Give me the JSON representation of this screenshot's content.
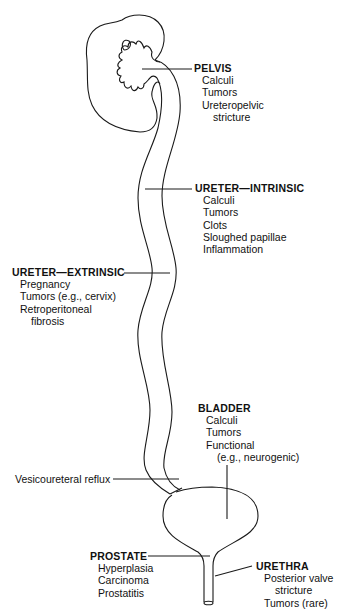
{
  "diagram": {
    "title": "",
    "labels": {
      "pelvis": {
        "heading": "PELVIS",
        "items": [
          "Calculi",
          "Tumors",
          "Ureteropelvic",
          "stricture"
        ]
      },
      "ureter_intrinsic": {
        "heading": "URETER—INTRINSIC",
        "items": [
          "Calculi",
          "Tumors",
          "Clots",
          "Sloughed papillae",
          "Inflammation"
        ]
      },
      "ureter_extrinsic": {
        "heading": "URETER—EXTRINSIC",
        "items": [
          "Pregnancy",
          "Tumors (e.g., cervix)",
          "Retroperitoneal",
          "fibrosis"
        ]
      },
      "bladder": {
        "heading": "BLADDER",
        "items": [
          "Calculi",
          "Tumors",
          "Functional",
          "(e.g., neurogenic)"
        ]
      },
      "vesicoureteral": {
        "text": "Vesicoureteral reflux"
      },
      "prostate": {
        "heading": "PROSTATE",
        "items": [
          "Hyperplasia",
          "Carcinoma",
          "Prostatitis"
        ]
      },
      "urethra": {
        "heading": "URETHRA",
        "items": [
          "Posterior valve",
          "stricture",
          "Tumors (rare)"
        ]
      }
    },
    "colors": {
      "line": "#1a1a1a",
      "background": "#ffffff"
    }
  }
}
